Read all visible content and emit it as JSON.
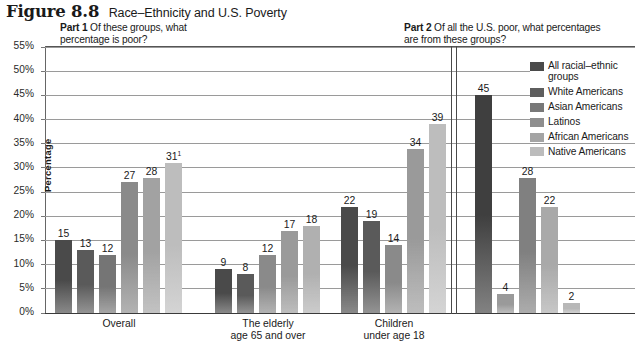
{
  "figure": {
    "number": "Figure 8.8",
    "title": "Race–Ethnicity and U.S. Poverty"
  },
  "parts": {
    "part1": {
      "tag": "Part 1",
      "text": "Of these groups, what percentage is poor?"
    },
    "part2": {
      "tag": "Part 2",
      "text": "Of all the U.S. poor, what percentages are from these groups?"
    }
  },
  "axis": {
    "y_title": "Percentage",
    "y_ticks": [
      "55%",
      "50%",
      "45%",
      "40%",
      "35%",
      "30%",
      "25%",
      "20%",
      "15%",
      "10%",
      "5%",
      "0%"
    ]
  },
  "legend": {
    "items": [
      {
        "label": "All racial–ethnic groups",
        "color": "#4a4a4a"
      },
      {
        "label": "White Americans",
        "color": "#5e5e5e"
      },
      {
        "label": "Asian Americans",
        "color": "#787878"
      },
      {
        "label": "Latinos",
        "color": "#8e8e8e"
      },
      {
        "label": "African Americans",
        "color": "#a4a4a4"
      },
      {
        "label": "Native Americans",
        "color": "#bcbcbc"
      }
    ]
  },
  "chart_data": {
    "type": "bar",
    "title": "Race–Ethnicity and U.S. Poverty",
    "xlabel": "",
    "ylabel": "Percentage",
    "ylim": [
      0,
      55
    ],
    "ytick_step": 5,
    "grid": true,
    "legend_position": "right",
    "panels": [
      {
        "name": "Part 1",
        "subtitle": "Of these groups, what percentage is poor?",
        "categories": [
          "Overall",
          "The elderly age 65 and over",
          "Children under age 18"
        ],
        "series": [
          {
            "name": "All racial–ethnic groups",
            "color": "#4a4a4a",
            "values": [
              15,
              9,
              22
            ]
          },
          {
            "name": "White Americans",
            "color": "#5e5e5e",
            "values": [
              13,
              8,
              19
            ]
          },
          {
            "name": "Asian Americans",
            "color": "#787878",
            "values": [
              12,
              12,
              14
            ]
          },
          {
            "name": "Latinos",
            "color": "#8e8e8e",
            "values": [
              27,
              17,
              34
            ]
          },
          {
            "name": "African Americans",
            "color": "#a4a4a4",
            "values": [
              28,
              18,
              null
            ]
          },
          {
            "name": "Native Americans",
            "color": "#bcbcbc",
            "values": [
              31,
              null,
              39
            ]
          }
        ],
        "annotations": [
          {
            "category": "Overall",
            "series": "Native Americans",
            "label": "31",
            "superscript": "1"
          }
        ]
      },
      {
        "name": "Part 2",
        "subtitle": "Of all the U.S. poor, what percentages are from these groups?",
        "categories": [
          ""
        ],
        "series": [
          {
            "name": "All racial–ethnic groups",
            "color": "#3f3f3f",
            "values": [
              45
            ]
          },
          {
            "name": "White Americans",
            "color": "#9a9a9a",
            "values": [
              4
            ]
          },
          {
            "name": "Asian Americans",
            "color": "#808080",
            "values": [
              28
            ]
          },
          {
            "name": "Latinos",
            "color": "#a9a9a9",
            "values": [
              22
            ]
          },
          {
            "name": "African Americans",
            "color": "#b8b8b8",
            "values": [
              2
            ]
          }
        ]
      }
    ]
  },
  "bars": [
    {
      "id": "p1-overall-all",
      "value": "15",
      "sup": "",
      "num": 15,
      "x": 10,
      "w": 17,
      "color": "#4a4a4a"
    },
    {
      "id": "p1-overall-white",
      "value": "13",
      "sup": "",
      "num": 13,
      "x": 32,
      "w": 17,
      "color": "#5a5a5a"
    },
    {
      "id": "p1-overall-asian",
      "value": "12",
      "sup": "",
      "num": 12,
      "x": 54,
      "w": 17,
      "color": "#757575"
    },
    {
      "id": "p1-overall-latino",
      "value": "27",
      "sup": "",
      "num": 27,
      "x": 76,
      "w": 17,
      "color": "#8a8a8a"
    },
    {
      "id": "p1-overall-african",
      "value": "28",
      "sup": "",
      "num": 28,
      "x": 98,
      "w": 17,
      "color": "#a2a2a2"
    },
    {
      "id": "p1-overall-native",
      "value": "31",
      "sup": "1",
      "num": 31,
      "x": 120,
      "w": 17,
      "color": "#bdbdbd"
    },
    {
      "id": "p1-elderly-all",
      "value": "9",
      "sup": "",
      "num": 9,
      "x": 170,
      "w": 17,
      "color": "#4a4a4a"
    },
    {
      "id": "p1-elderly-white",
      "value": "8",
      "sup": "",
      "num": 8,
      "x": 192,
      "w": 17,
      "color": "#5a5a5a"
    },
    {
      "id": "p1-elderly-asian",
      "value": "12",
      "sup": "",
      "num": 12,
      "x": 214,
      "w": 17,
      "color": "#8a8a8a"
    },
    {
      "id": "p1-elderly-latino",
      "value": "17",
      "sup": "",
      "num": 17,
      "x": 236,
      "w": 17,
      "color": "#9a9a9a"
    },
    {
      "id": "p1-elderly-african",
      "value": "18",
      "sup": "",
      "num": 18,
      "x": 258,
      "w": 17,
      "color": "#b0b0b0"
    },
    {
      "id": "p1-children-all",
      "value": "22",
      "sup": "",
      "num": 22,
      "x": 296,
      "w": 17,
      "color": "#4a4a4a"
    },
    {
      "id": "p1-children-white",
      "value": "19",
      "sup": "",
      "num": 19,
      "x": 318,
      "w": 17,
      "color": "#5a5a5a"
    },
    {
      "id": "p1-children-asian",
      "value": "14",
      "sup": "",
      "num": 14,
      "x": 340,
      "w": 17,
      "color": "#8a8a8a"
    },
    {
      "id": "p1-children-latino",
      "value": "34",
      "sup": "",
      "num": 34,
      "x": 362,
      "w": 17,
      "color": "#9a9a9a"
    },
    {
      "id": "p1-children-native",
      "value": "39",
      "sup": "",
      "num": 39,
      "x": 384,
      "w": 17,
      "color": "#bdbdbd"
    },
    {
      "id": "p2-all",
      "value": "45",
      "sup": "",
      "num": 45,
      "x": 430,
      "w": 17,
      "color": "#3f3f3f"
    },
    {
      "id": "p2-white",
      "value": "4",
      "sup": "",
      "num": 4,
      "x": 452,
      "w": 17,
      "color": "#9a9a9a"
    },
    {
      "id": "p2-asian",
      "value": "28",
      "sup": "",
      "num": 28,
      "x": 474,
      "w": 17,
      "color": "#808080"
    },
    {
      "id": "p2-latino",
      "value": "22",
      "sup": "",
      "num": 22,
      "x": 496,
      "w": 17,
      "color": "#a9a9a9"
    },
    {
      "id": "p2-african",
      "value": "2",
      "sup": "",
      "num": 2,
      "x": 518,
      "w": 17,
      "color": "#b8b8b8"
    }
  ],
  "group_labels": [
    {
      "id": "overall",
      "lines": [
        "Overall"
      ],
      "x": 74
    },
    {
      "id": "elderly",
      "lines": [
        "The elderly",
        "age 65 and over"
      ],
      "x": 223
    },
    {
      "id": "children",
      "lines": [
        "Children",
        "under age 18"
      ],
      "x": 349
    }
  ]
}
